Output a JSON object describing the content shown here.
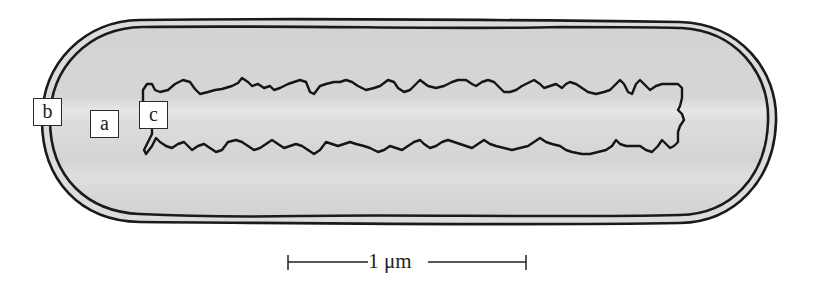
{
  "figure": {
    "type": "bacterial cell schematic",
    "labels": [
      {
        "id": "b",
        "text": "b"
      },
      {
        "id": "a",
        "text": "a"
      },
      {
        "id": "c",
        "text": "c"
      }
    ],
    "scale_bar": {
      "text": "1 μm"
    },
    "colors": {
      "cytoplasm": "#d6d6d6",
      "cytoplasm_highlight": "#e4e4e4",
      "outline": "#1a1a1a",
      "envelope_gap": "#dcdcdc",
      "background": "#ffffff"
    }
  }
}
